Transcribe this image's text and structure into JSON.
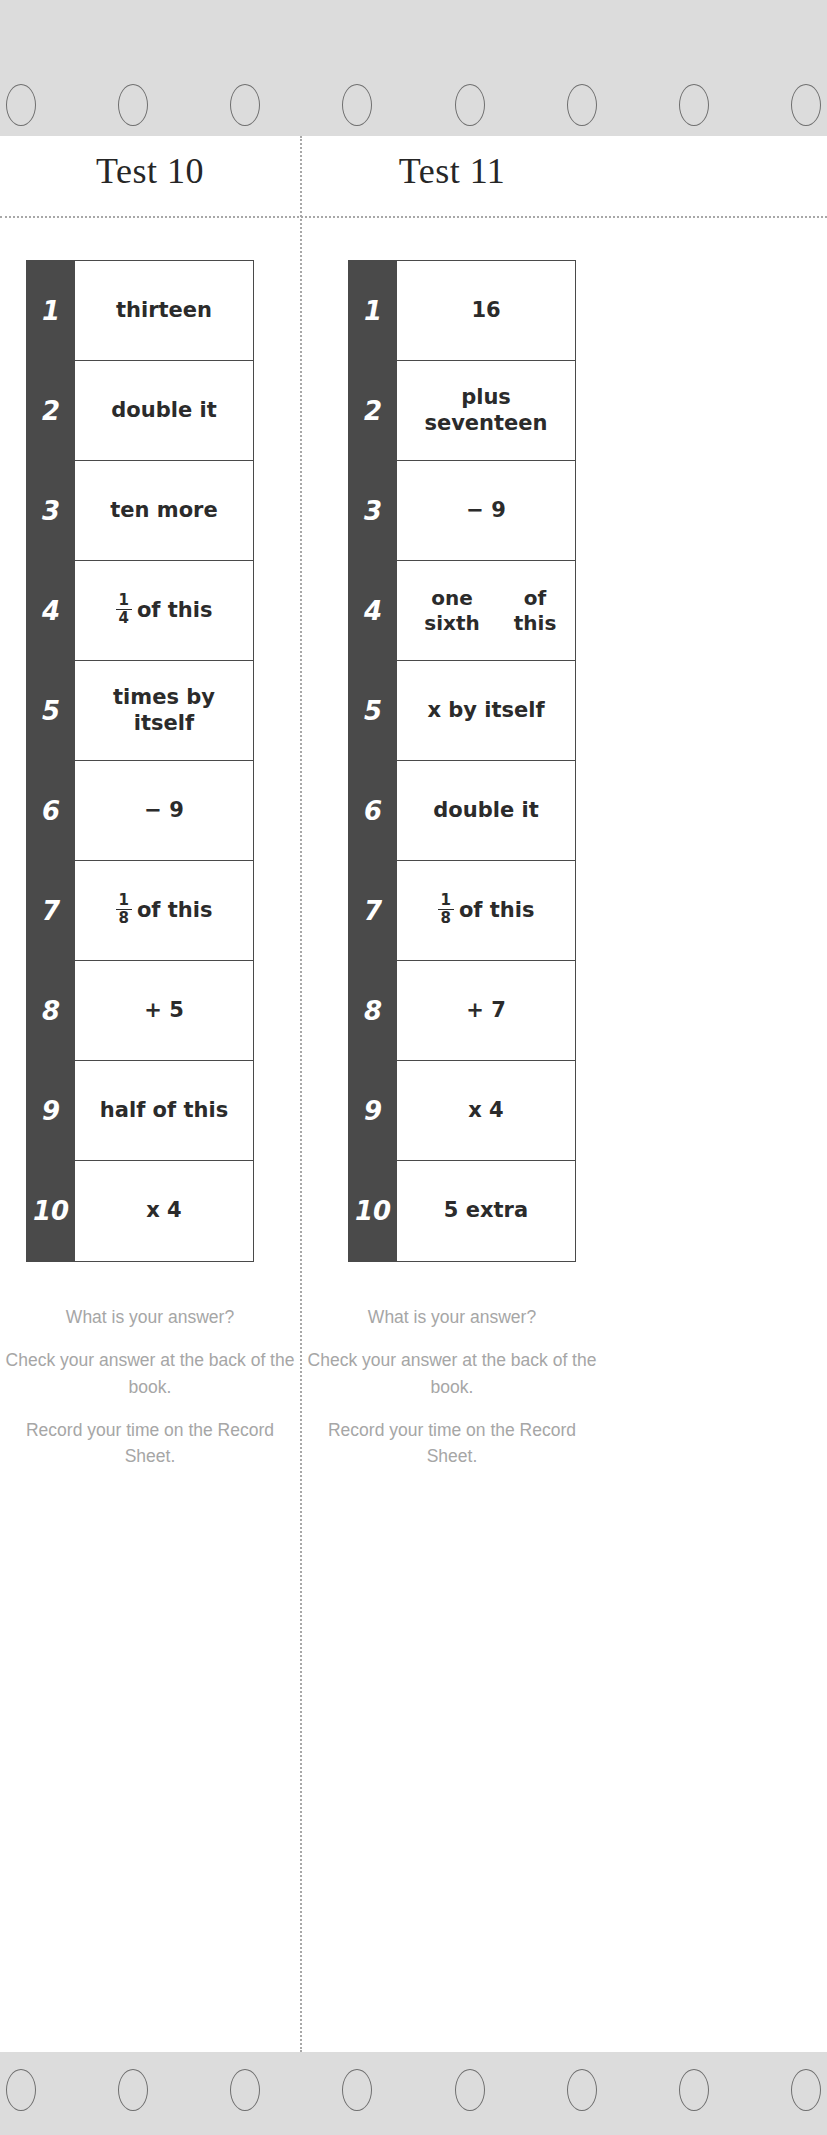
{
  "page": {
    "binding_hole_count": 8,
    "divider_style": "dotted",
    "colors": {
      "binding_strip": "#dcdcdc",
      "hole_outline": "#6f6f6f",
      "number_column": "#4a4a4a",
      "table_border": "#4a4a4a",
      "body_text": "#2b2b2b",
      "footer_text": "#a6a6a6",
      "title_text": "#262626",
      "divider": "#a8a8a8"
    }
  },
  "tests": [
    {
      "title": "Test 10",
      "rows": [
        {
          "number": "1",
          "text": "thirteen",
          "fraction": null,
          "suffix": null,
          "lines": 1
        },
        {
          "number": "2",
          "text": "double it",
          "fraction": null,
          "suffix": null,
          "lines": 1
        },
        {
          "number": "3",
          "text": "ten more",
          "fraction": null,
          "suffix": null,
          "lines": 1
        },
        {
          "number": "4",
          "text": "¼ of this",
          "fraction": {
            "num": "1",
            "den": "4"
          },
          "suffix": "of this",
          "lines": 1
        },
        {
          "number": "5",
          "text": "times by itself",
          "fraction": null,
          "suffix": null,
          "lines": 1
        },
        {
          "number": "6",
          "text": "− 9",
          "fraction": null,
          "suffix": null,
          "lines": 1
        },
        {
          "number": "7",
          "text": "⅛ of this",
          "fraction": {
            "num": "1",
            "den": "8"
          },
          "suffix": "of this",
          "lines": 1
        },
        {
          "number": "8",
          "text": "+ 5",
          "fraction": null,
          "suffix": null,
          "lines": 1
        },
        {
          "number": "9",
          "text": "half of this",
          "fraction": null,
          "suffix": null,
          "lines": 1
        },
        {
          "number": "10",
          "text": "x 4",
          "fraction": null,
          "suffix": null,
          "lines": 1
        }
      ],
      "footer_notes": [
        "What is your answer?",
        "Check your answer at the back of the book.",
        "Record your time on the Record Sheet."
      ]
    },
    {
      "title": "Test 11",
      "rows": [
        {
          "number": "1",
          "text": "16",
          "fraction": null,
          "suffix": null,
          "lines": 1
        },
        {
          "number": "2",
          "text": "plus seventeen",
          "fraction": null,
          "suffix": null,
          "lines": 1
        },
        {
          "number": "3",
          "text": "− 9",
          "fraction": null,
          "suffix": null,
          "lines": 1
        },
        {
          "number": "4",
          "text": "one sixth of this",
          "fraction": null,
          "suffix": null,
          "lines": 2
        },
        {
          "number": "5",
          "text": "x by itself",
          "fraction": null,
          "suffix": null,
          "lines": 1
        },
        {
          "number": "6",
          "text": "double it",
          "fraction": null,
          "suffix": null,
          "lines": 1
        },
        {
          "number": "7",
          "text": "⅛ of this",
          "fraction": {
            "num": "1",
            "den": "8"
          },
          "suffix": "of this",
          "lines": 1
        },
        {
          "number": "8",
          "text": "+ 7",
          "fraction": null,
          "suffix": null,
          "lines": 1
        },
        {
          "number": "9",
          "text": "x 4",
          "fraction": null,
          "suffix": null,
          "lines": 1
        },
        {
          "number": "10",
          "text": "5 extra",
          "fraction": null,
          "suffix": null,
          "lines": 1
        }
      ],
      "footer_notes": [
        "What is your answer?",
        "Check your answer at the back of the book.",
        "Record your time on the Record Sheet."
      ]
    }
  ]
}
